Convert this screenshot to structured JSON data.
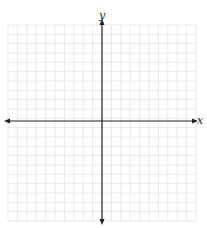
{
  "diagram": {
    "type": "coordinate-plane",
    "axes": {
      "x_label": "x",
      "y_label": "y"
    },
    "grid": {
      "columns": 20,
      "rows": 21,
      "left": 8,
      "top": 25,
      "right": 196,
      "bottom": 221,
      "line_color": "#e3e3e3"
    },
    "axis_color": "#222222",
    "origin_px": {
      "x": 102,
      "y": 121
    }
  }
}
